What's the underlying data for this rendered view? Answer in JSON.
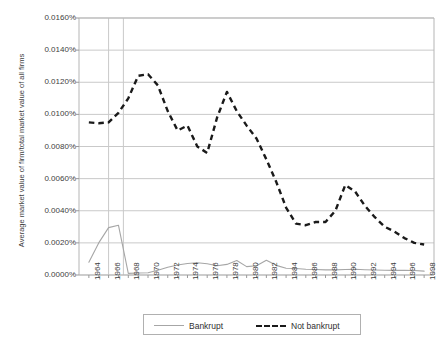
{
  "chart_data": {
    "type": "line",
    "title": "",
    "xlabel": "",
    "ylabel": "Average market value of firm/total market value of all firms",
    "xlim": [
      1963,
      1999
    ],
    "ylim": [
      0.0,
      0.016
    ],
    "y_tick_format": "percent-4dp",
    "grid": "horizontal",
    "legend_position": "bottom",
    "y_ticks": [
      "0.0000%",
      "0.0020%",
      "0.0040%",
      "0.0060%",
      "0.0080%",
      "0.0100%",
      "0.0120%",
      "0.0140%",
      "0.0160%"
    ],
    "y_tick_values": [
      0.0,
      0.002,
      0.004,
      0.006,
      0.008,
      0.01,
      0.012,
      0.014,
      0.016
    ],
    "x_ticks": [
      "1964",
      "1966",
      "1968",
      "1970",
      "1972",
      "1974",
      "1976",
      "1978",
      "1980",
      "1982",
      "1984",
      "1986",
      "1988",
      "1990",
      "1992",
      "1994",
      "1996",
      "1998"
    ],
    "x_tick_values": [
      1964,
      1966,
      1968,
      1970,
      1972,
      1974,
      1976,
      1978,
      1980,
      1982,
      1984,
      1986,
      1988,
      1990,
      1992,
      1994,
      1996,
      1998
    ],
    "x": [
      1964,
      1965,
      1966,
      1967,
      1968,
      1969,
      1970,
      1971,
      1972,
      1973,
      1974,
      1975,
      1976,
      1977,
      1978,
      1979,
      1980,
      1981,
      1982,
      1983,
      1984,
      1985,
      1986,
      1987,
      1988,
      1989,
      1990,
      1991,
      1992,
      1993,
      1994,
      1995,
      1996,
      1997,
      1998
    ],
    "series": [
      {
        "name": "Bankrupt",
        "style": "solid",
        "color": "#a6a6a6",
        "values": [
          0.0008,
          0.002,
          0.00295,
          0.0031,
          0.0001,
          0.00012,
          0.00014,
          0.0003,
          0.00048,
          0.00062,
          0.00072,
          0.00076,
          0.0007,
          0.00058,
          0.00066,
          0.0009,
          0.00052,
          0.00058,
          0.00092,
          0.0006,
          0.00042,
          0.0004,
          0.00036,
          0.00034,
          0.00032,
          0.00032,
          0.00034,
          0.00036,
          0.00033,
          0.00031,
          0.0003,
          0.00029,
          0.00029,
          0.00028,
          0.00024
        ]
      },
      {
        "name": "Not bankrupt",
        "style": "dashed",
        "color": "#1a1a1a",
        "values": [
          0.0095,
          0.00945,
          0.0095,
          0.0101,
          0.011,
          0.0124,
          0.0125,
          0.0118,
          0.0102,
          0.009,
          0.0093,
          0.008,
          0.0076,
          0.0098,
          0.0114,
          0.0102,
          0.0093,
          0.0085,
          0.0072,
          0.0058,
          0.0042,
          0.0032,
          0.0031,
          0.0033,
          0.0033,
          0.004,
          0.0056,
          0.0052,
          0.0043,
          0.0036,
          0.003,
          0.0027,
          0.0023,
          0.002,
          0.0019
        ],
        "note_segments": [
          {
            "years": [
              1964,
              1966
            ],
            "value_range": [
              0.0094,
              0.0095
            ]
          },
          {
            "years": [
              1970,
              1971
            ],
            "value_range": [
              0.0124,
              0.0125
            ],
            "label": "peak"
          },
          {
            "years": [
              1986,
              1988
            ],
            "value_range": [
              0.003,
              0.0033
            ],
            "label": "trough"
          },
          {
            "years": [
              1990,
              1991
            ],
            "value_range": [
              0.0052,
              0.0056
            ],
            "label": "secondary bump"
          }
        ]
      }
    ],
    "legend": [
      {
        "label": "Bankrupt",
        "style": "solid",
        "color": "#a6a6a6"
      },
      {
        "label": "Not bankrupt",
        "style": "dashed",
        "color": "#1a1a1a"
      }
    ],
    "vertical_gridlines_at": [
      1966,
      1967.5
    ]
  }
}
